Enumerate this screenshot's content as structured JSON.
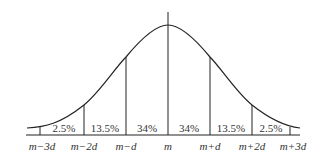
{
  "diagram": {
    "type": "normal-distribution",
    "stroke_color": "#222222",
    "background": "#ffffff",
    "percentages": [
      {
        "label": "2.5%",
        "x": 62
      },
      {
        "label": "13.5%",
        "x": 105
      },
      {
        "label": "34%",
        "x": 147
      },
      {
        "label": "34%",
        "x": 189
      },
      {
        "label": "13.5%",
        "x": 231
      },
      {
        "label": "2.5%",
        "x": 273
      }
    ],
    "axis_labels": [
      {
        "label": "m−3d",
        "x": 37
      },
      {
        "label": "m−2d",
        "x": 84
      },
      {
        "label": "m−d",
        "x": 126
      },
      {
        "label": "m",
        "x": 168
      },
      {
        "label": "m+d",
        "x": 210
      },
      {
        "label": "m+2d",
        "x": 252
      },
      {
        "label": "m+3d",
        "x": 297
      }
    ]
  }
}
